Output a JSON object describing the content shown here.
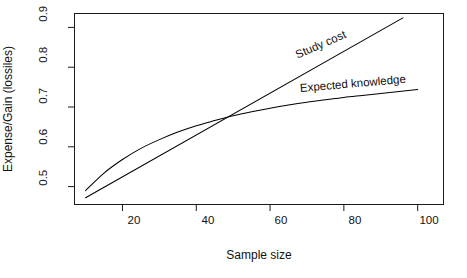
{
  "chart_data": {
    "type": "line",
    "title": "",
    "subtitle": "",
    "xlabel": "Sample size",
    "ylabel": "Expense/Gain (lossiles)",
    "xlim": [
      7,
      107
    ],
    "ylim": [
      0.455,
      0.935
    ],
    "xticks": [
      20,
      40,
      60,
      80,
      100
    ],
    "xtick_labels": [
      "20",
      "40",
      "60",
      "80",
      "100"
    ],
    "yticks": [
      0.5,
      0.6,
      0.7,
      0.8,
      0.9
    ],
    "ytick_labels": [
      "0.5",
      "0.6",
      "0.7",
      "0.8",
      "0.9"
    ],
    "grid": false,
    "legend_position": "inline-annotations",
    "box": true,
    "series": [
      {
        "name": "Study cost",
        "shape": "straight-line",
        "color": "#000000",
        "label_angle_deg": -23.5,
        "x": [
          10,
          20,
          30,
          40,
          45,
          50,
          60,
          70,
          80,
          90,
          96
        ],
        "values": [
          0.472,
          0.525,
          0.577,
          0.63,
          0.656,
          0.682,
          0.735,
          0.787,
          0.84,
          0.892,
          0.924
        ]
      },
      {
        "name": "Expected knowledge",
        "shape": "concave-saturating-curve",
        "color": "#000000",
        "label_angle_deg": -5.0,
        "x": [
          10,
          15,
          20,
          25,
          30,
          35,
          40,
          45,
          50,
          55,
          60,
          65,
          70,
          75,
          80,
          85,
          90,
          95,
          100
        ],
        "values": [
          0.49,
          0.534,
          0.568,
          0.596,
          0.618,
          0.637,
          0.653,
          0.666,
          0.678,
          0.688,
          0.697,
          0.705,
          0.712,
          0.718,
          0.724,
          0.729,
          0.734,
          0.739,
          0.744
        ]
      }
    ],
    "annotations": [
      {
        "text": "Study cost",
        "x": 62,
        "y": 0.795
      },
      {
        "text": "Expected knowledge",
        "x": 63,
        "y": 0.733
      }
    ],
    "intersection": {
      "x": 45,
      "y": 0.665
    }
  },
  "figure": {
    "background_color": "#ffffff",
    "axis_color": "#1a1a1a",
    "series_color": "#000000"
  }
}
